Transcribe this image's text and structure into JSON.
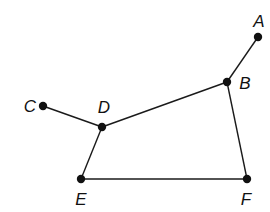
{
  "diagram": {
    "type": "graph",
    "width": 270,
    "height": 212,
    "colors": {
      "edge": "#1a1a1a",
      "vertex": "#111111",
      "label": "#111111",
      "background": "#ffffff"
    },
    "vertices": [
      {
        "id": "A",
        "label": "A",
        "x": 258,
        "y": 37,
        "label_x": 259,
        "label_y": 27
      },
      {
        "id": "B",
        "label": "B",
        "x": 227,
        "y": 82,
        "label_x": 245,
        "label_y": 89
      },
      {
        "id": "C",
        "label": "C",
        "x": 43,
        "y": 106,
        "label_x": 30,
        "label_y": 112
      },
      {
        "id": "D",
        "label": "D",
        "x": 102,
        "y": 127,
        "label_x": 104,
        "label_y": 113
      },
      {
        "id": "E",
        "label": "E",
        "x": 81,
        "y": 179,
        "label_x": 81,
        "label_y": 205
      },
      {
        "id": "F",
        "label": "F",
        "x": 247,
        "y": 179,
        "label_x": 246,
        "label_y": 205
      }
    ],
    "edges": [
      {
        "from": "A",
        "to": "B"
      },
      {
        "from": "B",
        "to": "D"
      },
      {
        "from": "C",
        "to": "D"
      },
      {
        "from": "D",
        "to": "E"
      },
      {
        "from": "E",
        "to": "F"
      },
      {
        "from": "B",
        "to": "F"
      }
    ]
  }
}
